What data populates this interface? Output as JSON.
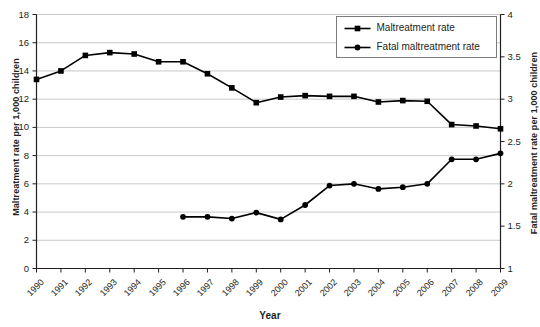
{
  "chart_data": {
    "type": "line",
    "title": "",
    "xlabel": "Year",
    "ylabel": "Maltreatment rate per 1,000 children",
    "ylabel_right": "Fatal maltreatment rate per 1,000 children",
    "grid": true,
    "legend_position": "top-right",
    "categories": [
      1990,
      1991,
      1992,
      1993,
      1994,
      1995,
      1996,
      1997,
      1998,
      1999,
      2000,
      2001,
      2002,
      2003,
      2004,
      2005,
      2006,
      2007,
      2008,
      2009
    ],
    "xtick_labels": [
      "1990",
      "1991",
      "1992",
      "1993",
      "1994",
      "1995",
      "1996",
      "1997",
      "1998",
      "1999",
      "2000",
      "2001",
      "2002",
      "2003",
      "2004",
      "2005",
      "2006",
      "2007",
      "2008",
      "2009"
    ],
    "ylim": [
      0,
      18
    ],
    "ytick_labels": [
      "0",
      "2",
      "4",
      "6",
      "8",
      "10",
      "12",
      "14",
      "16",
      "18"
    ],
    "ytick_values": [
      0,
      2,
      4,
      6,
      8,
      10,
      12,
      14,
      16,
      18
    ],
    "ylim_right": [
      1,
      4
    ],
    "ytick_labels_right": [
      "1",
      "1.5",
      "2",
      "2.5",
      "3",
      "3.5",
      "4"
    ],
    "ytick_values_right": [
      1,
      1.5,
      2,
      2.5,
      3,
      3.5,
      4
    ],
    "series": [
      {
        "name": "Maltreatment rate",
        "axis": "left",
        "marker": "square",
        "x": [
          1990,
          1991,
          1992,
          1993,
          1994,
          1995,
          1996,
          1997,
          1998,
          1999,
          2000,
          2001,
          2002,
          2003,
          2004,
          2005,
          2006,
          2007,
          2008,
          2009
        ],
        "values": [
          13.4,
          14.0,
          15.1,
          15.3,
          15.2,
          14.65,
          14.65,
          13.8,
          12.8,
          11.75,
          12.15,
          12.25,
          12.2,
          12.2,
          11.8,
          11.9,
          11.85,
          10.2,
          10.1,
          9.9
        ]
      },
      {
        "name": "Fatal maltreatment rate",
        "axis": "right",
        "marker": "circle",
        "x": [
          1996,
          1997,
          1998,
          1999,
          2000,
          2001,
          2002,
          2003,
          2004,
          2005,
          2006,
          2007,
          2008,
          2009
        ],
        "values": [
          1.61,
          1.61,
          1.59,
          1.66,
          1.58,
          1.75,
          1.98,
          2.0,
          1.94,
          1.96,
          2.0,
          2.29,
          2.29,
          2.36
        ]
      }
    ],
    "legend": [
      {
        "label": "Maltreatment rate",
        "marker": "square"
      },
      {
        "label": "Fatal maltreatment rate",
        "marker": "circle"
      }
    ]
  }
}
